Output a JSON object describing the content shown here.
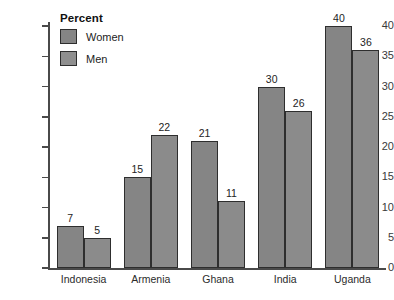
{
  "chart_data": {
    "type": "bar",
    "title": "",
    "xlabel": "",
    "ylabel": "",
    "ylim": [
      0,
      40
    ],
    "ytick_step": 5,
    "yticks": [
      "0",
      "5",
      "10",
      "15",
      "20",
      "25",
      "30",
      "35",
      "40"
    ],
    "grid": false,
    "legend_position": "inside-top-left",
    "legend_title": "Percent",
    "categories": [
      "Indonesia",
      "Armenia",
      "Ghana",
      "India",
      "Uganda"
    ],
    "series": [
      {
        "name": "Women",
        "values": [
          7,
          15,
          21,
          30,
          40
        ],
        "color": "#858585"
      },
      {
        "name": "Men",
        "values": [
          5,
          22,
          11,
          26,
          36
        ],
        "color": "#8f8f8f"
      }
    ]
  },
  "colors": {
    "bar_fill_women": "#858585",
    "bar_fill_men": "#8f8f8f",
    "bar_outline": "#2e2e2e",
    "axis": "#4a4a4a",
    "background": "#ffffff",
    "text": "#232323"
  }
}
